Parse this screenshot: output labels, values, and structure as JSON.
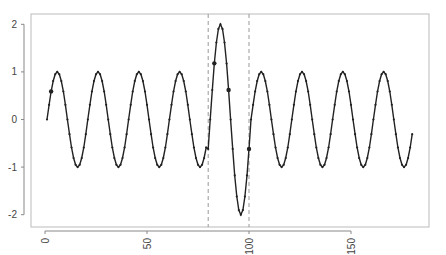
{
  "chart_data": {
    "type": "line",
    "title": "",
    "xlabel": "",
    "ylabel": "",
    "xlim": [
      -7,
      186
    ],
    "ylim": [
      -2.2,
      2.2
    ],
    "grid": false,
    "legend": null,
    "x_ticks": [
      0,
      50,
      100,
      150
    ],
    "x_tick_labels": [
      "0",
      "50",
      "100",
      "150"
    ],
    "y_ticks": [
      2,
      1,
      0,
      -1,
      -2
    ],
    "y_tick_labels": [
      "2",
      "1",
      "0",
      "-1",
      "-2"
    ],
    "series": [
      {
        "name": "signal",
        "description": "sine wave with period 20, amplitude 1; amplitude doubled (2) between t=80 and t=100",
        "x_start": 1,
        "x_end": 180,
        "period": 20,
        "amplitude": 1,
        "anomaly": {
          "x_from": 80,
          "x_to": 100,
          "amplitude": 2
        },
        "color": "#222222"
      }
    ],
    "highlighted_points": [
      {
        "x": 3,
        "y": 0.59
      },
      {
        "x": 83,
        "y": 1.18
      },
      {
        "x": 90,
        "y": 0.62
      },
      {
        "x": 100,
        "y": -0.62
      }
    ],
    "vertical_lines": [
      {
        "x": 80,
        "style": "dashed",
        "color": "#999999"
      },
      {
        "x": 100,
        "style": "dashed",
        "color": "#999999"
      }
    ]
  },
  "colors": {
    "line": "#222222",
    "axis": "#888888",
    "frame": "#bbbbbb",
    "dashed": "#999999"
  }
}
